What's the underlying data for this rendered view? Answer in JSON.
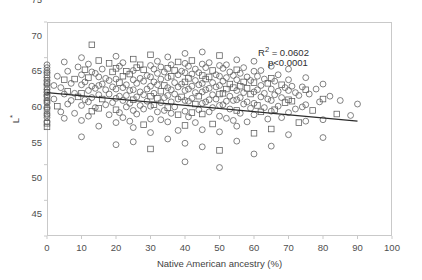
{
  "chart_data": {
    "type": "scatter",
    "title": "",
    "xlabel": "Native American ancestry (%)",
    "ylabel": "L*",
    "xlim": [
      0,
      100
    ],
    "ylim": [
      45,
      75
    ],
    "xticks": [
      0,
      10,
      20,
      30,
      40,
      50,
      60,
      70,
      80,
      90,
      100
    ],
    "xtick_labels": [
      "0",
      "10",
      "20",
      "30",
      "40",
      "50",
      "60",
      "70",
      "80",
      "90",
      "100"
    ],
    "yticks": [
      45,
      50,
      55,
      60,
      65,
      70,
      75
    ],
    "ytick_labels": [
      "45",
      "50",
      "55",
      "60",
      "65",
      "70",
      "75"
    ],
    "grid": false,
    "legend": null,
    "marker": {
      "shape": "open-circle",
      "size": 3.1,
      "edge_color": "#5a5a5a",
      "fill": "none"
    },
    "annotations": [
      {
        "name": "r-squared",
        "text_prefix": "R",
        "text_sup": "2",
        "text_suffix": " = 0.0602"
      },
      {
        "name": "p-value",
        "text": "p<0.0001"
      }
    ],
    "trendline": {
      "type": "linear",
      "color": "#2b2b2b",
      "width": 1.15,
      "x_start": 0,
      "y_start": 65.1,
      "x_end": 90,
      "y_end": 61.1,
      "slope": -0.0444,
      "intercept": 65.1
    },
    "points": [
      [
        0,
        69.0
      ],
      [
        0,
        68.6
      ],
      [
        0,
        68.2
      ],
      [
        0,
        67.6
      ],
      [
        0,
        67.2
      ],
      [
        0,
        66.8
      ],
      [
        0,
        66.3
      ],
      [
        0,
        65.9
      ],
      [
        0,
        65.5
      ],
      [
        0,
        65.1
      ],
      [
        0,
        64.8
      ],
      [
        0,
        64.4
      ],
      [
        0,
        64.0
      ],
      [
        0,
        63.6
      ],
      [
        0,
        63.1
      ],
      [
        0,
        62.6
      ],
      [
        0,
        62.1
      ],
      [
        0,
        61.6
      ],
      [
        0,
        61.0
      ],
      [
        0,
        60.3
      ],
      [
        0,
        65.2
      ],
      [
        0,
        64.6
      ],
      [
        0,
        63.8
      ],
      [
        0,
        66.5
      ],
      [
        0,
        67.9
      ],
      [
        0,
        62.9
      ],
      [
        0,
        61.9
      ],
      [
        0,
        60.8
      ],
      [
        2,
        66.1
      ],
      [
        2,
        64.2
      ],
      [
        3,
        67.4
      ],
      [
        3,
        63.2
      ],
      [
        4,
        65.8
      ],
      [
        4,
        62.4
      ],
      [
        5,
        69.4
      ],
      [
        5,
        66.9
      ],
      [
        5,
        64.9
      ],
      [
        5,
        61.5
      ],
      [
        6,
        68.1
      ],
      [
        6,
        65.3
      ],
      [
        6,
        63.5
      ],
      [
        7,
        66.4
      ],
      [
        7,
        64.0
      ],
      [
        8,
        67.0
      ],
      [
        8,
        65.0
      ],
      [
        8,
        62.2
      ],
      [
        9,
        68.7
      ],
      [
        9,
        64.5
      ],
      [
        10,
        70.0
      ],
      [
        10,
        67.6
      ],
      [
        10,
        66.2
      ],
      [
        10,
        65.0
      ],
      [
        10,
        63.3
      ],
      [
        10,
        61.2
      ],
      [
        10,
        58.9
      ],
      [
        11,
        68.3
      ],
      [
        11,
        66.6
      ],
      [
        11,
        64.1
      ],
      [
        12,
        69.1
      ],
      [
        12,
        67.2
      ],
      [
        12,
        65.4
      ],
      [
        12,
        63.8
      ],
      [
        12,
        61.8
      ],
      [
        13,
        71.8
      ],
      [
        13,
        68.0
      ],
      [
        13,
        66.0
      ],
      [
        13,
        64.4
      ],
      [
        13,
        62.5
      ],
      [
        14,
        67.8
      ],
      [
        14,
        65.7
      ],
      [
        14,
        63.0
      ],
      [
        15,
        69.6
      ],
      [
        15,
        67.3
      ],
      [
        15,
        66.1
      ],
      [
        15,
        64.8
      ],
      [
        15,
        62.9
      ],
      [
        15,
        60.4
      ],
      [
        16,
        68.4
      ],
      [
        16,
        66.3
      ],
      [
        16,
        64.2
      ],
      [
        17,
        67.1
      ],
      [
        17,
        65.5
      ],
      [
        17,
        63.4
      ],
      [
        18,
        69.2
      ],
      [
        18,
        66.8
      ],
      [
        18,
        64.9
      ],
      [
        18,
        62.0
      ],
      [
        19,
        68.0
      ],
      [
        19,
        65.9
      ],
      [
        19,
        63.7
      ],
      [
        20,
        70.2
      ],
      [
        20,
        68.5
      ],
      [
        20,
        67.0
      ],
      [
        20,
        65.6
      ],
      [
        20,
        64.3
      ],
      [
        20,
        62.7
      ],
      [
        20,
        60.9
      ],
      [
        20,
        57.8
      ],
      [
        21,
        68.8
      ],
      [
        21,
        66.5
      ],
      [
        21,
        64.6
      ],
      [
        21,
        62.3
      ],
      [
        22,
        69.3
      ],
      [
        22,
        67.4
      ],
      [
        22,
        65.8
      ],
      [
        22,
        64.0
      ],
      [
        22,
        61.6
      ],
      [
        23,
        68.1
      ],
      [
        23,
        66.2
      ],
      [
        23,
        64.7
      ],
      [
        23,
        63.1
      ],
      [
        24,
        67.7
      ],
      [
        24,
        65.4
      ],
      [
        24,
        63.6
      ],
      [
        24,
        61.1
      ],
      [
        25,
        69.8
      ],
      [
        25,
        68.2
      ],
      [
        25,
        66.9
      ],
      [
        25,
        65.5
      ],
      [
        25,
        64.1
      ],
      [
        25,
        62.6
      ],
      [
        25,
        60.2
      ],
      [
        25,
        58.2
      ],
      [
        26,
        68.6
      ],
      [
        26,
        66.4
      ],
      [
        26,
        64.5
      ],
      [
        26,
        62.1
      ],
      [
        27,
        69.0
      ],
      [
        27,
        67.1
      ],
      [
        27,
        65.2
      ],
      [
        27,
        63.3
      ],
      [
        28,
        68.3
      ],
      [
        28,
        66.7
      ],
      [
        28,
        64.8
      ],
      [
        28,
        62.8
      ],
      [
        28,
        60.6
      ],
      [
        29,
        67.5
      ],
      [
        29,
        65.6
      ],
      [
        29,
        63.9
      ],
      [
        30,
        70.4
      ],
      [
        30,
        68.9
      ],
      [
        30,
        67.3
      ],
      [
        30,
        66.0
      ],
      [
        30,
        64.6
      ],
      [
        30,
        63.2
      ],
      [
        30,
        61.4
      ],
      [
        30,
        59.5
      ],
      [
        30,
        57.2
      ],
      [
        31,
        68.4
      ],
      [
        31,
        66.6
      ],
      [
        31,
        65.0
      ],
      [
        31,
        63.4
      ],
      [
        32,
        69.5
      ],
      [
        32,
        67.8
      ],
      [
        32,
        66.2
      ],
      [
        32,
        64.3
      ],
      [
        32,
        62.4
      ],
      [
        33,
        68.7
      ],
      [
        33,
        67.0
      ],
      [
        33,
        65.3
      ],
      [
        33,
        63.7
      ],
      [
        33,
        61.3
      ],
      [
        34,
        68.0
      ],
      [
        34,
        66.1
      ],
      [
        34,
        64.4
      ],
      [
        34,
        62.6
      ],
      [
        35,
        70.1
      ],
      [
        35,
        68.5
      ],
      [
        35,
        67.2
      ],
      [
        35,
        65.8
      ],
      [
        35,
        64.7
      ],
      [
        35,
        63.0
      ],
      [
        35,
        61.0
      ],
      [
        35,
        58.6
      ],
      [
        36,
        69.0
      ],
      [
        36,
        67.4
      ],
      [
        36,
        65.5
      ],
      [
        36,
        63.8
      ],
      [
        36,
        62.2
      ],
      [
        37,
        68.2
      ],
      [
        37,
        66.5
      ],
      [
        37,
        64.9
      ],
      [
        37,
        63.1
      ],
      [
        38,
        69.4
      ],
      [
        38,
        67.6
      ],
      [
        38,
        65.9
      ],
      [
        38,
        64.2
      ],
      [
        38,
        62.0
      ],
      [
        38,
        59.8
      ],
      [
        39,
        68.1
      ],
      [
        39,
        66.3
      ],
      [
        39,
        64.5
      ],
      [
        40,
        70.6
      ],
      [
        40,
        69.2
      ],
      [
        40,
        67.9
      ],
      [
        40,
        66.6
      ],
      [
        40,
        65.4
      ],
      [
        40,
        64.0
      ],
      [
        40,
        62.5
      ],
      [
        40,
        60.5
      ],
      [
        40,
        58.0
      ],
      [
        40,
        55.4
      ],
      [
        41,
        68.8
      ],
      [
        41,
        67.1
      ],
      [
        41,
        65.6
      ],
      [
        41,
        63.9
      ],
      [
        41,
        61.7
      ],
      [
        42,
        69.6
      ],
      [
        42,
        67.7
      ],
      [
        42,
        66.0
      ],
      [
        42,
        64.3
      ],
      [
        42,
        62.3
      ],
      [
        43,
        68.4
      ],
      [
        43,
        66.8
      ],
      [
        43,
        65.1
      ],
      [
        43,
        63.5
      ],
      [
        43,
        60.9
      ],
      [
        44,
        67.9
      ],
      [
        44,
        66.2
      ],
      [
        44,
        64.6
      ],
      [
        44,
        62.7
      ],
      [
        45,
        70.8
      ],
      [
        45,
        69.1
      ],
      [
        45,
        67.5
      ],
      [
        45,
        66.4
      ],
      [
        45,
        65.2
      ],
      [
        45,
        63.6
      ],
      [
        45,
        62.1
      ],
      [
        45,
        59.9
      ],
      [
        45,
        57.5
      ],
      [
        46,
        68.6
      ],
      [
        46,
        67.0
      ],
      [
        46,
        65.5
      ],
      [
        46,
        63.8
      ],
      [
        47,
        69.3
      ],
      [
        47,
        67.3
      ],
      [
        47,
        65.7
      ],
      [
        47,
        64.1
      ],
      [
        47,
        62.4
      ],
      [
        48,
        68.2
      ],
      [
        48,
        66.5
      ],
      [
        48,
        64.8
      ],
      [
        48,
        63.0
      ],
      [
        48,
        60.7
      ],
      [
        49,
        67.6
      ],
      [
        49,
        65.9
      ],
      [
        49,
        64.2
      ],
      [
        50,
        70.3
      ],
      [
        50,
        68.9
      ],
      [
        50,
        67.4
      ],
      [
        50,
        66.1
      ],
      [
        50,
        64.9
      ],
      [
        50,
        63.3
      ],
      [
        50,
        61.8
      ],
      [
        50,
        59.6
      ],
      [
        50,
        57.0
      ],
      [
        50,
        54.6
      ],
      [
        51,
        68.5
      ],
      [
        51,
        66.7
      ],
      [
        51,
        65.0
      ],
      [
        51,
        63.4
      ],
      [
        52,
        69.0
      ],
      [
        52,
        67.2
      ],
      [
        52,
        65.6
      ],
      [
        52,
        63.9
      ],
      [
        52,
        61.5
      ],
      [
        53,
        68.0
      ],
      [
        53,
        66.3
      ],
      [
        53,
        64.6
      ],
      [
        53,
        62.8
      ],
      [
        54,
        67.5
      ],
      [
        54,
        65.8
      ],
      [
        54,
        64.0
      ],
      [
        54,
        61.2
      ],
      [
        55,
        69.7
      ],
      [
        55,
        68.3
      ],
      [
        55,
        66.9
      ],
      [
        55,
        65.4
      ],
      [
        55,
        64.1
      ],
      [
        55,
        62.6
      ],
      [
        55,
        60.4
      ],
      [
        55,
        58.3
      ],
      [
        56,
        67.8
      ],
      [
        56,
        66.0
      ],
      [
        56,
        64.4
      ],
      [
        56,
        62.2
      ],
      [
        57,
        68.6
      ],
      [
        57,
        66.6
      ],
      [
        57,
        65.1
      ],
      [
        57,
        63.5
      ],
      [
        58,
        67.3
      ],
      [
        58,
        65.7
      ],
      [
        58,
        63.8
      ],
      [
        58,
        61.0
      ],
      [
        59,
        66.8
      ],
      [
        59,
        64.9
      ],
      [
        59,
        62.9
      ],
      [
        60,
        69.5
      ],
      [
        60,
        68.1
      ],
      [
        60,
        66.5
      ],
      [
        60,
        65.2
      ],
      [
        60,
        63.6
      ],
      [
        60,
        62.0
      ],
      [
        60,
        59.4
      ],
      [
        60,
        56.5
      ],
      [
        61,
        67.4
      ],
      [
        61,
        65.5
      ],
      [
        61,
        63.3
      ],
      [
        62,
        68.2
      ],
      [
        62,
        66.1
      ],
      [
        62,
        64.5
      ],
      [
        62,
        62.4
      ],
      [
        63,
        67.0
      ],
      [
        63,
        65.0
      ],
      [
        63,
        63.0
      ],
      [
        64,
        66.4
      ],
      [
        64,
        64.2
      ],
      [
        64,
        61.4
      ],
      [
        65,
        68.8
      ],
      [
        65,
        67.1
      ],
      [
        65,
        65.6
      ],
      [
        65,
        64.0
      ],
      [
        65,
        62.5
      ],
      [
        65,
        60.0
      ],
      [
        65,
        57.6
      ],
      [
        66,
        66.7
      ],
      [
        66,
        64.8
      ],
      [
        66,
        62.7
      ],
      [
        67,
        67.6
      ],
      [
        67,
        65.3
      ],
      [
        67,
        63.2
      ],
      [
        68,
        66.2
      ],
      [
        68,
        64.4
      ],
      [
        68,
        61.6
      ],
      [
        69,
        65.8
      ],
      [
        69,
        63.7
      ],
      [
        70,
        68.4
      ],
      [
        70,
        66.9
      ],
      [
        70,
        65.4
      ],
      [
        70,
        64.1
      ],
      [
        70,
        62.3
      ],
      [
        70,
        59.2
      ],
      [
        71,
        66.0
      ],
      [
        71,
        63.9
      ],
      [
        72,
        65.1
      ],
      [
        72,
        62.8
      ],
      [
        73,
        64.7
      ],
      [
        73,
        60.9
      ],
      [
        74,
        65.9
      ],
      [
        74,
        63.1
      ],
      [
        75,
        67.2
      ],
      [
        75,
        65.5
      ],
      [
        75,
        63.4
      ],
      [
        75,
        61.1
      ],
      [
        76,
        64.9
      ],
      [
        77,
        62.6
      ],
      [
        78,
        65.6
      ],
      [
        79,
        63.8
      ],
      [
        80,
        66.3
      ],
      [
        80,
        64.2
      ],
      [
        80,
        61.3
      ],
      [
        80,
        58.8
      ],
      [
        82,
        64.6
      ],
      [
        84,
        62.1
      ],
      [
        85,
        64.0
      ],
      [
        88,
        61.9
      ],
      [
        90,
        63.5
      ]
    ]
  },
  "axes": {
    "ytitle_main": "L",
    "ytitle_sup": "*",
    "xtitle": "Native American ancestry (%)"
  },
  "annotations_text": {
    "r2_prefix": "R",
    "r2_sup": "2",
    "r2_value": " = 0.0602",
    "p_value": "p<0.0001"
  },
  "colors": {
    "frame": "#c9c9c9",
    "marker_edge": "#5a5a5a",
    "trendline": "#2b2b2b",
    "tick_text": "#4f4f4f",
    "background": "#ffffff"
  }
}
